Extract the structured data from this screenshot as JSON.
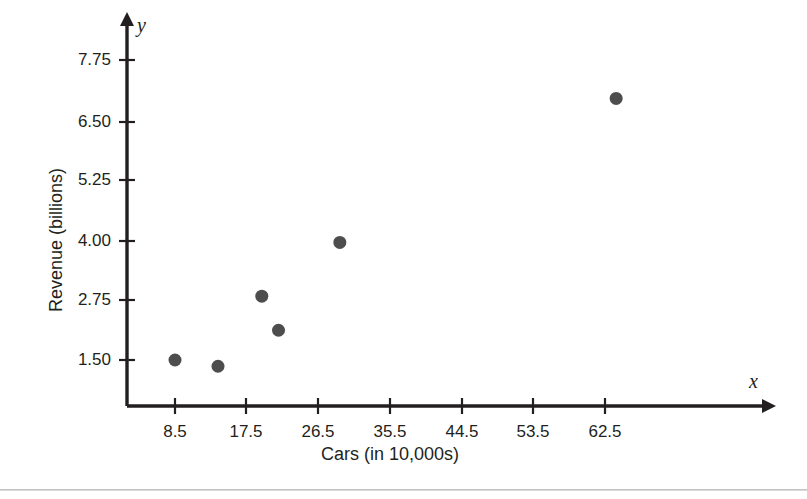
{
  "chart_data": {
    "type": "scatter",
    "title": "",
    "xlabel": "Cars (in 10,000s)",
    "ylabel": "Revenue (billions)",
    "x_var": "x",
    "y_var": "y",
    "xlim": [
      0,
      68
    ],
    "ylim": [
      0.6,
      8.3
    ],
    "grid": false,
    "legend": null,
    "x_ticks": [
      "8.5",
      "17.5",
      "26.5",
      "35.5",
      "44.5",
      "53.5",
      "62.5"
    ],
    "x_tick_values": [
      8.5,
      17.5,
      26.5,
      35.5,
      44.5,
      53.5,
      62.5
    ],
    "y_ticks": [
      "1.50",
      "2.75",
      "4.00",
      "5.25",
      "6.50",
      "7.75"
    ],
    "y_tick_values": [
      1.5,
      2.75,
      4.0,
      5.25,
      6.5,
      7.75
    ],
    "marker": {
      "shape": "circle",
      "color": "#4d4d4d",
      "size": 13
    },
    "points": [
      {
        "x": 8.5,
        "y": 1.5
      },
      {
        "x": 13.9,
        "y": 1.37
      },
      {
        "x": 19.4,
        "y": 2.83
      },
      {
        "x": 21.5,
        "y": 2.12
      },
      {
        "x": 29.2,
        "y": 3.95
      },
      {
        "x": 63.9,
        "y": 6.95
      }
    ],
    "axis_color": "#231f20"
  },
  "colors": {
    "background": "#ffffff",
    "axis": "#231f20",
    "marker": "#4d4d4d",
    "text": "#231f20",
    "divider": "#c4c4c4"
  }
}
